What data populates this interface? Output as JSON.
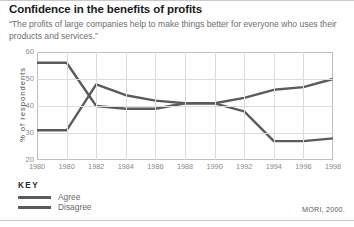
{
  "figure": {
    "title": "Confidence in the benefits of profits",
    "subtitle": "“The profits of large companies help to make things better for everyone who uses their products and services.”",
    "source": "MORI, 2000."
  },
  "key": {
    "heading": "KEY",
    "items": [
      {
        "label": "Agree",
        "color": "#5b5b5b"
      },
      {
        "label": "Disagree",
        "color": "#5b5b5b"
      }
    ]
  },
  "chart_data": {
    "type": "line",
    "title": "Confidence in the benefits of profits",
    "subtitle": "“The profits of large companies help to make things better for everyone who uses their products and services.”",
    "xlabel": "",
    "ylabel": "% of respondents",
    "x": [
      1980,
      1980,
      1982,
      1984,
      1986,
      1988,
      1990,
      1992,
      1994,
      1996,
      1998
    ],
    "xtick_labels": [
      "1980",
      "1980",
      "1982",
      "1984",
      "1986",
      "1988",
      "1990",
      "1992",
      "1994",
      "1996",
      "1998"
    ],
    "ylim": [
      20,
      60
    ],
    "yticks": [
      20,
      30,
      40,
      50,
      60
    ],
    "ytick_labels": [
      "20",
      "30",
      "40",
      "50",
      "60"
    ],
    "grid": true,
    "legend_position": "below-left",
    "series": [
      {
        "name": "Agree",
        "color": "#5b5b5b",
        "values": [
          31,
          31,
          48,
          44,
          42,
          41,
          41,
          43,
          46,
          47,
          50
        ]
      },
      {
        "name": "Disagree",
        "color": "#5b5b5b",
        "values": [
          56,
          56,
          40,
          39,
          39,
          41,
          41,
          38,
          27,
          27,
          28
        ]
      }
    ],
    "annotations": [
      "MORI, 2000."
    ]
  }
}
